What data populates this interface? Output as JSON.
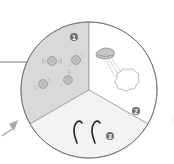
{
  "diagram": {
    "type": "segmented-circle",
    "segments": [
      {
        "number": "1",
        "label": "",
        "icon": "particles-vibrating-icon",
        "fill": "#d9d9d9"
      },
      {
        "number": "2",
        "label": "",
        "icon": "mouth-exhaling-cloud-icon",
        "fill": "#ffffff"
      },
      {
        "number": "3",
        "label": "",
        "icon": "rising-steam-wisps-icon",
        "fill": "#f2f2f2"
      }
    ],
    "colors": {
      "outline": "#777777",
      "badge": "#6e6e6e",
      "arrow": "#a8a8a8",
      "icon_stroke": "#8a8a8a",
      "wisp_stroke": "#222222"
    },
    "pointer_line": "left-leader-line",
    "arrow": "incoming-arrow-lower-left"
  }
}
